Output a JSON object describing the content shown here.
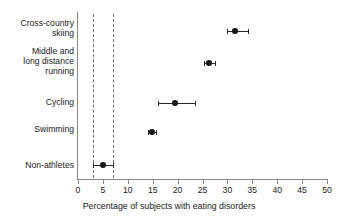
{
  "chart_data": {
    "type": "scatter",
    "title": "",
    "subtitle": "",
    "xlabel": "Percentage of subjects with eating disorders",
    "ylabel": "",
    "xlim": [
      0,
      50
    ],
    "xticks": [
      0,
      5,
      10,
      15,
      20,
      25,
      30,
      35,
      40,
      45,
      50
    ],
    "xtick_labels": [
      "0",
      "5",
      "10",
      "15",
      "20",
      "25",
      "30",
      "35",
      "40",
      "45",
      "50"
    ],
    "grid": false,
    "legend": "none",
    "orientation": "horizontal",
    "categories": [
      "Cross-country\nskiing",
      "Middle and\nlong distance\nrunning",
      "Cycling",
      "Swimming",
      "Non-athletes"
    ],
    "values": [
      31.5,
      26.3,
      19.5,
      14.9,
      5.0
    ],
    "errors_low": [
      29.9,
      25.4,
      16.0,
      14.0,
      3.0
    ],
    "errors_high": [
      34.2,
      27.5,
      23.5,
      15.6,
      7.0
    ],
    "points": [
      {
        "label": "Cross-country skiing",
        "value": 31.5,
        "ci_low": 29.9,
        "ci_high": 34.2
      },
      {
        "label": "Middle and long distance running",
        "value": 26.3,
        "ci_low": 25.4,
        "ci_high": 27.5
      },
      {
        "label": "Cycling",
        "value": 19.5,
        "ci_low": 16.0,
        "ci_high": 23.5
      },
      {
        "label": "Swimming",
        "value": 14.9,
        "ci_low": 14.0,
        "ci_high": 15.6
      },
      {
        "label": "Non-athletes",
        "value": 5.0,
        "ci_low": 3.0,
        "ci_high": 7.0
      }
    ],
    "annotations": [
      {
        "type": "vline",
        "x": 3.0,
        "style": "dashed"
      },
      {
        "type": "vline",
        "x": 7.0,
        "style": "dashed"
      }
    ],
    "colors": {
      "marker": "#1a1a1a",
      "errorbar": "#2b2b2b",
      "reference_line": "#6f6f6f",
      "axis": "#8a8a8a",
      "background": "#ffffff",
      "text": "#1a1a1a"
    }
  }
}
